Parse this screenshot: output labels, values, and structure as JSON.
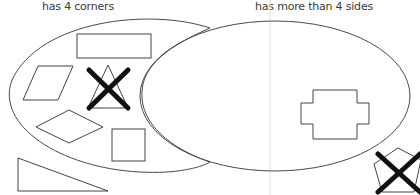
{
  "diagram": {
    "type": "venn",
    "sets": [
      {
        "id": "left",
        "label": "has 4 corners"
      },
      {
        "id": "right",
        "label": "has more than 4 sides"
      }
    ],
    "shapes": [
      {
        "name": "rectangle",
        "region": "left-only",
        "crossed": false
      },
      {
        "name": "parallelogram",
        "region": "left-only",
        "crossed": false
      },
      {
        "name": "triangle",
        "region": "left-only",
        "crossed": true
      },
      {
        "name": "rhombus",
        "region": "left-only",
        "crossed": false
      },
      {
        "name": "square",
        "region": "left-only",
        "crossed": false
      },
      {
        "name": "right-triangle",
        "region": "outside",
        "crossed": false
      },
      {
        "name": "cross-polygon",
        "region": "right-only",
        "crossed": false
      },
      {
        "name": "pentagon",
        "region": "outside",
        "crossed": true
      }
    ],
    "colors": {
      "stroke": "#4a4a4a",
      "cross": "#111111",
      "guide": "#dcdcdc"
    }
  }
}
